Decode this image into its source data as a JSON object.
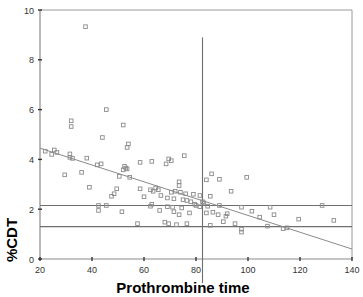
{
  "chart_data": {
    "type": "scatter",
    "title": "",
    "xlabel": "Prothrombine time",
    "ylabel": "%CDT",
    "xlim": [
      20,
      140
    ],
    "ylim": [
      0,
      10
    ],
    "xticks": [
      20,
      40,
      60,
      80,
      100,
      120,
      140
    ],
    "yticks": [
      0,
      2,
      4,
      6,
      8,
      10
    ],
    "grid": false,
    "legend": null,
    "marker": "open-square",
    "marker_color": "#8a8a8a",
    "reference_lines": {
      "horizontal": [
        2.15,
        1.3
      ],
      "vertical": [
        82.5
      ]
    },
    "regression_line": {
      "x": [
        20,
        140
      ],
      "y": [
        4.45,
        0.4
      ],
      "slope": -0.0338,
      "intercept": 5.12
    },
    "points": [
      [
        37.5,
        9.33
      ],
      [
        45.5,
        6.0
      ],
      [
        32.0,
        5.55
      ],
      [
        32.0,
        5.32
      ],
      [
        52.0,
        5.38
      ],
      [
        44.0,
        4.88
      ],
      [
        54.0,
        4.62
      ],
      [
        53.5,
        4.48
      ],
      [
        22.0,
        4.33
      ],
      [
        25.5,
        4.38
      ],
      [
        26.5,
        4.28
      ],
      [
        24.5,
        4.2
      ],
      [
        31.5,
        4.22
      ],
      [
        31.5,
        4.08
      ],
      [
        32.5,
        4.04
      ],
      [
        38.0,
        4.05
      ],
      [
        75.5,
        4.15
      ],
      [
        69.5,
        4.02
      ],
      [
        63.0,
        3.92
      ],
      [
        58.5,
        3.88
      ],
      [
        43.5,
        3.82
      ],
      [
        42.0,
        3.78
      ],
      [
        68.5,
        3.82
      ],
      [
        70.5,
        3.95
      ],
      [
        52.5,
        3.72
      ],
      [
        53.0,
        3.65
      ],
      [
        53.5,
        3.62
      ],
      [
        52.0,
        3.58
      ],
      [
        86.0,
        3.42
      ],
      [
        99.5,
        3.28
      ],
      [
        89.0,
        3.2
      ],
      [
        29.5,
        3.38
      ],
      [
        36.0,
        3.48
      ],
      [
        50.5,
        3.32
      ],
      [
        54.5,
        3.28
      ],
      [
        84.0,
        3.18
      ],
      [
        73.5,
        3.1
      ],
      [
        73.5,
        2.95
      ],
      [
        39.0,
        2.88
      ],
      [
        49.5,
        2.82
      ],
      [
        58.5,
        2.82
      ],
      [
        62.5,
        2.78
      ],
      [
        64.5,
        2.85
      ],
      [
        65.5,
        2.78
      ],
      [
        63.5,
        2.72
      ],
      [
        70.5,
        2.68
      ],
      [
        72.0,
        2.72
      ],
      [
        74.0,
        2.68
      ],
      [
        76.0,
        2.62
      ],
      [
        79.0,
        2.6
      ],
      [
        81.5,
        2.55
      ],
      [
        85.5,
        2.52
      ],
      [
        48.5,
        2.62
      ],
      [
        47.5,
        2.52
      ],
      [
        66.5,
        2.55
      ],
      [
        60.0,
        2.5
      ],
      [
        93.5,
        2.72
      ],
      [
        69.0,
        2.45
      ],
      [
        71.5,
        2.42
      ],
      [
        75.0,
        2.38
      ],
      [
        76.5,
        2.35
      ],
      [
        78.0,
        2.3
      ],
      [
        82.5,
        2.3
      ],
      [
        83.0,
        2.25
      ],
      [
        79.5,
        2.2
      ],
      [
        80.0,
        2.15
      ],
      [
        63.0,
        2.2
      ],
      [
        62.5,
        2.12
      ],
      [
        42.5,
        2.15
      ],
      [
        45.5,
        2.15
      ],
      [
        69.0,
        2.1
      ],
      [
        71.0,
        2.08
      ],
      [
        74.5,
        2.05
      ],
      [
        81.5,
        2.1
      ],
      [
        84.5,
        2.12
      ],
      [
        89.0,
        2.15
      ],
      [
        97.5,
        2.08
      ],
      [
        108.5,
        2.08
      ],
      [
        128.5,
        2.15
      ],
      [
        42.5,
        1.95
      ],
      [
        51.5,
        1.9
      ],
      [
        66.0,
        1.95
      ],
      [
        71.5,
        1.9
      ],
      [
        73.5,
        1.78
      ],
      [
        77.5,
        1.85
      ],
      [
        84.0,
        1.85
      ],
      [
        86.5,
        1.88
      ],
      [
        88.5,
        1.78
      ],
      [
        92.0,
        1.82
      ],
      [
        91.5,
        1.72
      ],
      [
        101.5,
        1.92
      ],
      [
        110.0,
        1.78
      ],
      [
        104.5,
        1.68
      ],
      [
        119.5,
        1.6
      ],
      [
        133.0,
        1.55
      ],
      [
        57.5,
        1.42
      ],
      [
        68.0,
        1.48
      ],
      [
        69.5,
        1.42
      ],
      [
        72.5,
        1.38
      ],
      [
        76.5,
        1.42
      ],
      [
        85.5,
        1.35
      ],
      [
        90.5,
        1.5
      ],
      [
        95.0,
        1.42
      ],
      [
        107.5,
        1.32
      ],
      [
        115.0,
        1.25
      ],
      [
        113.5,
        1.22
      ],
      [
        97.5,
        1.2
      ],
      [
        97.5,
        1.08
      ]
    ]
  }
}
